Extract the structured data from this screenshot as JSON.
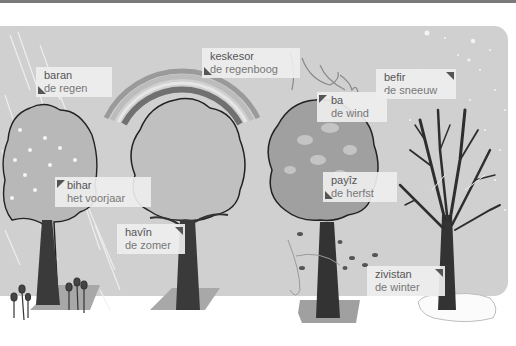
{
  "scene": {
    "title": "Seasons and weather vocabulary (Kurdish – Dutch)",
    "colors": {
      "sky": "#d0d0d0",
      "ground": "#ffffff",
      "canopy": "#b8b8b8",
      "canopy_autumn": "#9e9e9e",
      "trunk": "#3a3a3a",
      "shadow_patch": "#a8a8a8",
      "label_bg": "#eeeeee",
      "label_text": "#6a6a6a",
      "rainbow_bands": [
        "#9a9a9a",
        "#bcbcbc",
        "#8a8a8a",
        "#e6e6e6",
        "#6e6e6e"
      ]
    }
  },
  "labels": {
    "rain": {
      "ku": "baran",
      "nl": "de regen"
    },
    "rainbow": {
      "ku": "keskesor",
      "nl": "de regenboog"
    },
    "snow": {
      "ku": "befir",
      "nl": "de sneeuw"
    },
    "wind": {
      "ku": "ba",
      "nl": "de wind"
    },
    "spring": {
      "ku": "bihar",
      "nl": "het voorjaar"
    },
    "summer": {
      "ku": "havîn",
      "nl": "de zomer"
    },
    "autumn": {
      "ku": "payîz",
      "nl": "de herfst"
    },
    "winter": {
      "ku": "zivistan",
      "nl": "de winter"
    }
  },
  "icons": {
    "spring_tree": "spring-tree-icon",
    "summer_tree": "summer-tree-icon",
    "autumn_tree": "autumn-tree-icon",
    "winter_tree": "winter-tree-icon",
    "rainbow": "rainbow-icon",
    "rain": "rain-icon",
    "wind": "wind-icon",
    "snow": "snowflake-icon",
    "flowers": "tulip-icon",
    "falling_leaves": "falling-leaves-icon"
  }
}
